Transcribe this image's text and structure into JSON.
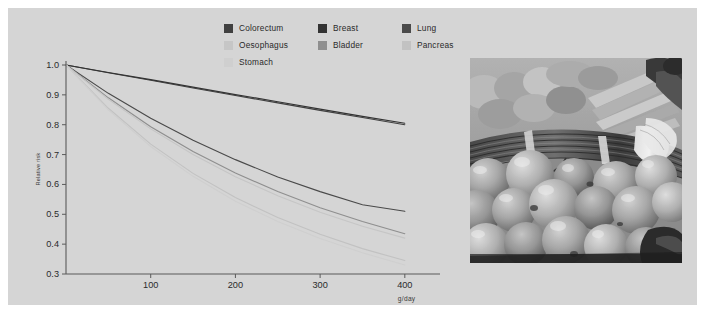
{
  "figure": {
    "panel_bg": "#d5d5d5",
    "outer_bg": "#ffffff"
  },
  "legend": {
    "items": [
      {
        "label": "Colorectum",
        "color": "#404040",
        "col": 0,
        "row": 0
      },
      {
        "label": "Oesophagus",
        "color": "#c6c6c6",
        "col": 0,
        "row": 1
      },
      {
        "label": "Stomach",
        "color": "#cfcfcf",
        "col": 0,
        "row": 2
      },
      {
        "label": "Breast",
        "color": "#333333",
        "col": 1,
        "row": 0
      },
      {
        "label": "Bladder",
        "color": "#8f8f8f",
        "col": 1,
        "row": 1
      },
      {
        "label": "Lung",
        "color": "#4a4a4a",
        "col": 2,
        "row": 0
      },
      {
        "label": "Pancreas",
        "color": "#c2c2c2",
        "col": 2,
        "row": 1
      }
    ]
  },
  "axes": {
    "ylabel": "Relative risk",
    "xlabel": "g/day",
    "yticks": [
      "1.0",
      "0.9",
      "0.8",
      "0.7",
      "0.6",
      "0.5",
      "0.4",
      "0.3"
    ],
    "xticks": [
      "100",
      "200",
      "300",
      "400"
    ]
  },
  "photo": {
    "alt_name": "vegetables-photograph",
    "description": "black and white photograph of tomatoes, spring onions and peppers at a market stall"
  },
  "chart_data": {
    "type": "line",
    "title": "",
    "xlabel": "g/day",
    "ylabel": "Relative risk",
    "xlim": [
      0,
      425
    ],
    "ylim": [
      0.3,
      1.0
    ],
    "grid": false,
    "legend_position": "top-center",
    "x": [
      0,
      50,
      100,
      150,
      200,
      250,
      300,
      350,
      400
    ],
    "series": [
      {
        "name": "Colorectum",
        "color": "#404040",
        "values": [
          1.0,
          0.974,
          0.949,
          0.923,
          0.898,
          0.873,
          0.848,
          0.824,
          0.8
        ]
      },
      {
        "name": "Breast",
        "color": "#333333",
        "values": [
          1.0,
          0.975,
          0.951,
          0.926,
          0.901,
          0.877,
          0.852,
          0.828,
          0.805
        ]
      },
      {
        "name": "Lung",
        "color": "#4a4a4a",
        "values": [
          1.0,
          0.905,
          0.822,
          0.748,
          0.683,
          0.625,
          0.576,
          0.532,
          0.51
        ]
      },
      {
        "name": "Bladder",
        "color": "#8f8f8f",
        "values": [
          1.0,
          0.89,
          0.793,
          0.71,
          0.638,
          0.576,
          0.522,
          0.476,
          0.435
        ]
      },
      {
        "name": "Oesophagus",
        "color": "#c6c6c6",
        "values": [
          1.0,
          0.885,
          0.786,
          0.7,
          0.626,
          0.562,
          0.507,
          0.46,
          0.42
        ]
      },
      {
        "name": "Pancreas",
        "color": "#c2c2c2",
        "values": [
          1.0,
          0.855,
          0.735,
          0.637,
          0.556,
          0.489,
          0.433,
          0.385,
          0.345
        ]
      },
      {
        "name": "Stomach",
        "color": "#cfcfcf",
        "values": [
          1.0,
          0.85,
          0.727,
          0.627,
          0.544,
          0.476,
          0.419,
          0.371,
          0.33
        ]
      }
    ]
  }
}
